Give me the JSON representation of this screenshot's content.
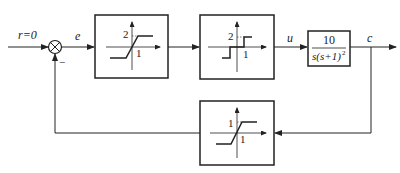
{
  "diagram": {
    "type": "nonlinear control system block diagram",
    "input": {
      "label": "r=0"
    },
    "summing_junction": {
      "feedback_sign": "−"
    },
    "signals": {
      "error": "e",
      "control": "u",
      "output": "c"
    },
    "blocks": [
      {
        "id": "saturation-1",
        "kind": "saturation",
        "y_label": "2",
        "x_label": "1"
      },
      {
        "id": "relay-deadzone",
        "kind": "relay with dead zone",
        "y_label": "2",
        "x_label": "1"
      },
      {
        "id": "plant",
        "kind": "linear transfer function",
        "numerator": "10",
        "denominator_parts": {
          "base": "s(s+1)",
          "exp": "2"
        }
      },
      {
        "id": "saturation-feedback",
        "kind": "saturation",
        "y_label": "1",
        "x_label": "1"
      }
    ]
  }
}
